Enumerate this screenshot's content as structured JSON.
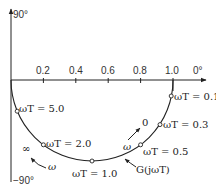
{
  "axes": {
    "y_top_label": "90°",
    "y_bottom_label": "−90°",
    "x_right_label": "0°",
    "x_ticks": [
      "0.2",
      "0.4",
      "0.6",
      "0.8",
      "1.0"
    ]
  },
  "curve": {
    "name": "G(jωT)",
    "points": [
      {
        "label": "ωT = 0.1",
        "w": 0.1
      },
      {
        "label": "ωT = 0.3",
        "w": 0.3
      },
      {
        "label": "ωT = 0.5",
        "w": 0.5
      },
      {
        "label": "ωT = 1.0",
        "w": 1.0
      },
      {
        "label": "ωT = 2.0",
        "w": 2.0
      },
      {
        "label": "ωT = 5.0",
        "w": 5.0
      }
    ]
  },
  "annotations": {
    "omega_zero": "0",
    "omega_inf": "∞",
    "omega": "ω",
    "curve_label": "G(jωT)"
  }
}
